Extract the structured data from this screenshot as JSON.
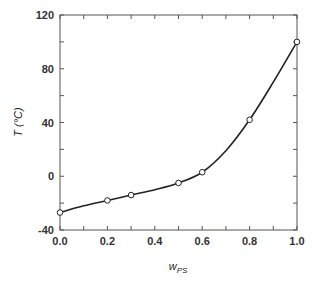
{
  "chart_data": {
    "type": "line",
    "title": "",
    "xlabel": "w",
    "xlabel_subscript": "PS",
    "ylabel": "T (°C)",
    "xlim": [
      0.0,
      1.0
    ],
    "ylim": [
      -40,
      120
    ],
    "x_ticks": [
      "0.0",
      "0.2",
      "0.4",
      "0.6",
      "0.8",
      "1.0"
    ],
    "y_ticks": [
      "-40",
      "0",
      "40",
      "80",
      "120"
    ],
    "grid": false,
    "legend": null,
    "series": [
      {
        "name": "measured",
        "marker": "open-circle",
        "x": [
          0.0,
          0.2,
          0.3,
          0.5,
          0.6,
          0.8,
          1.0
        ],
        "y": [
          -27,
          -18,
          -14,
          -5,
          3,
          42,
          100
        ]
      },
      {
        "name": "fit",
        "style": "solid-line",
        "x": [
          0.0,
          0.1,
          0.2,
          0.3,
          0.4,
          0.5,
          0.6,
          0.7,
          0.8,
          0.9,
          1.0
        ],
        "y": [
          -27,
          -22,
          -18,
          -14,
          -10,
          -5,
          3,
          19,
          42,
          70,
          100
        ]
      }
    ]
  }
}
